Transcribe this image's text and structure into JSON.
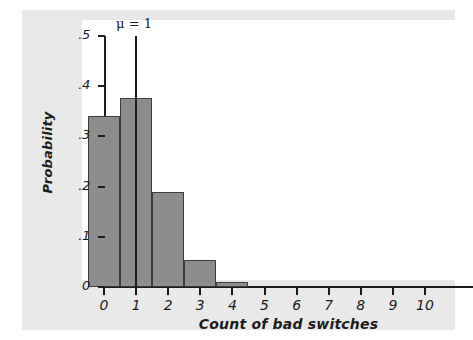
{
  "chart_data": {
    "type": "bar",
    "title": "",
    "subtitle": "",
    "xlabel": "Count of bad switches",
    "ylabel": "Probability",
    "categories": [
      "0",
      "1",
      "2",
      "3",
      "4",
      "5",
      "6",
      "7",
      "8",
      "9",
      "10"
    ],
    "values": [
      0.34,
      0.377,
      0.189,
      0.053,
      0.009,
      0.0,
      0.0,
      0.0,
      0.0,
      0.0,
      0.0
    ],
    "xlim": [
      -0.7,
      10.7
    ],
    "ylim": [
      0,
      0.5
    ],
    "y_ticks": [
      0,
      0.1,
      0.2,
      0.3,
      0.4,
      0.5
    ],
    "y_tick_labels": [
      "0",
      ".1",
      ".2",
      ".3",
      ".4",
      ".5"
    ],
    "x_ticks": [
      0,
      1,
      2,
      3,
      4,
      5,
      6,
      7,
      8,
      9,
      10
    ],
    "x_tick_labels": [
      "0",
      "1",
      "2",
      "3",
      "4",
      "5",
      "6",
      "7",
      "8",
      "9",
      "10"
    ],
    "grid": false,
    "legend": "none",
    "annotations": [
      {
        "name": "mean-marker",
        "label": "μ = 1",
        "x": 1,
        "y_from": 0,
        "y_to": 0.5,
        "style": "vertical-line"
      }
    ],
    "colors": {
      "bar_fill": "#8d8d8d",
      "bar_edge": "#3c3c3c",
      "axis": "#1b1b1b",
      "panel_background": "#e9e9e9",
      "plot_background": "#ffffff"
    }
  }
}
